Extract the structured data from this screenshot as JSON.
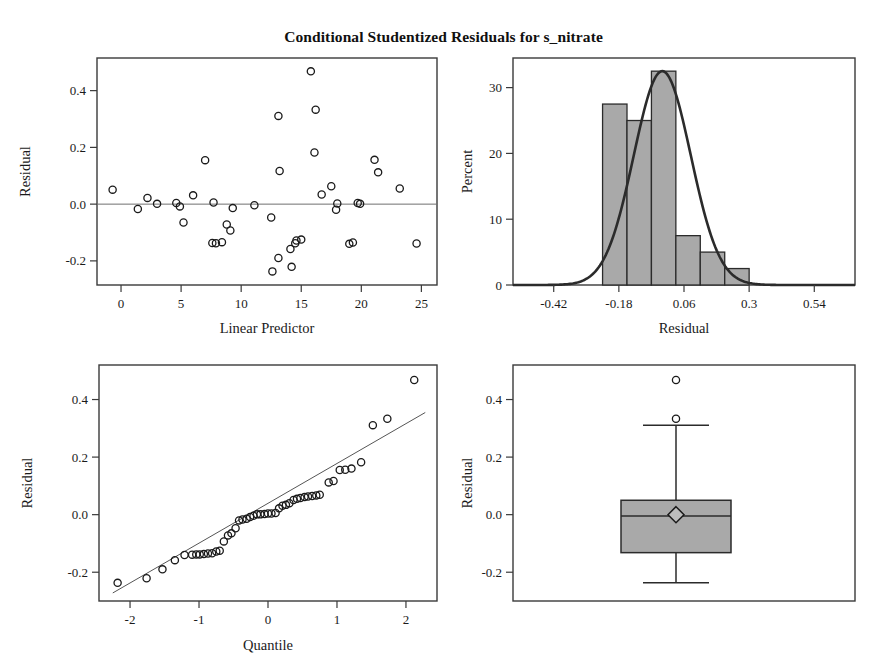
{
  "title": "Conditional Studentized Residuals for s_nitrate",
  "chart_data": [
    {
      "type": "scatter",
      "name": "residual-vs-linear-predictor",
      "title": "",
      "xlabel": "Linear Predictor",
      "ylabel": "Residual",
      "xlim": [
        -2.0,
        26.3
      ],
      "ylim": [
        -0.285,
        0.515
      ],
      "xticks": [
        0,
        5,
        10,
        15,
        20,
        25
      ],
      "xtick_labels": [
        "0",
        "5",
        "10",
        "15",
        "20",
        "25"
      ],
      "yticks": [
        -0.2,
        0.0,
        0.2,
        0.4
      ],
      "ytick_labels": [
        "-0.2",
        "0.0",
        "0.2",
        "0.4"
      ],
      "grid": false,
      "reference_line_y": 0.0,
      "points": [
        [
          -0.7,
          0.051
        ],
        [
          1.4,
          -0.017
        ],
        [
          2.2,
          0.022
        ],
        [
          3.0,
          0.001
        ],
        [
          4.6,
          0.004
        ],
        [
          4.9,
          -0.008
        ],
        [
          5.2,
          -0.065
        ],
        [
          6.0,
          0.031
        ],
        [
          7.0,
          0.155
        ],
        [
          7.6,
          -0.137
        ],
        [
          7.9,
          -0.138
        ],
        [
          8.4,
          -0.134
        ],
        [
          8.8,
          -0.072
        ],
        [
          9.1,
          -0.093
        ],
        [
          9.3,
          -0.014
        ],
        [
          7.7,
          0.006
        ],
        [
          11.1,
          -0.004
        ],
        [
          12.5,
          -0.047
        ],
        [
          12.6,
          -0.237
        ],
        [
          13.1,
          0.311
        ],
        [
          13.2,
          0.117
        ],
        [
          13.1,
          -0.19
        ],
        [
          14.1,
          -0.158
        ],
        [
          14.2,
          -0.221
        ],
        [
          14.5,
          -0.138
        ],
        [
          14.6,
          -0.128
        ],
        [
          15.0,
          -0.125
        ],
        [
          15.8,
          0.468
        ],
        [
          16.2,
          0.333
        ],
        [
          16.1,
          0.182
        ],
        [
          16.7,
          0.034
        ],
        [
          17.5,
          0.063
        ],
        [
          17.9,
          -0.02
        ],
        [
          18.0,
          0.002
        ],
        [
          19.0,
          -0.14
        ],
        [
          19.3,
          -0.135
        ],
        [
          19.7,
          0.004
        ],
        [
          19.9,
          0.001
        ],
        [
          21.1,
          0.156
        ],
        [
          21.4,
          0.112
        ],
        [
          23.2,
          0.055
        ],
        [
          24.6,
          -0.139
        ]
      ]
    },
    {
      "type": "bar",
      "name": "residual-histogram",
      "title": "",
      "xlabel": "Residual",
      "ylabel": "Percent",
      "xlim": [
        -0.57,
        0.69
      ],
      "ylim": [
        0,
        34.5
      ],
      "xticks": [
        -0.42,
        -0.18,
        0.06,
        0.3,
        0.54
      ],
      "xtick_labels": [
        "-0.42",
        "-0.18",
        "0.06",
        "0.3",
        "0.54"
      ],
      "yticks": [
        0,
        10,
        20,
        30
      ],
      "ytick_labels": [
        "0",
        "10",
        "20",
        "30"
      ],
      "grid": false,
      "bin_edges": [
        -0.24,
        -0.15,
        -0.06,
        0.03,
        0.12,
        0.21,
        0.3
      ],
      "bin_width": 0.09,
      "values": [
        27.5,
        25.0,
        32.5,
        7.5,
        5.0,
        2.5
      ],
      "overlay_curve": {
        "name": "normal-density",
        "mean": -0.02,
        "std": 0.105,
        "peak_percent": 32.5
      }
    },
    {
      "type": "scatter",
      "name": "residual-qq-plot",
      "title": "",
      "xlabel": "Quantile",
      "ylabel": "Residual",
      "xlim": [
        -2.45,
        2.45
      ],
      "ylim": [
        -0.3,
        0.52
      ],
      "xticks": [
        -2,
        -1,
        0,
        1,
        2
      ],
      "xtick_labels": [
        "-2",
        "-1",
        "0",
        "1",
        "2"
      ],
      "yticks": [
        -0.2,
        0.0,
        0.2,
        0.4
      ],
      "ytick_labels": [
        "-0.2",
        "0.0",
        "0.2",
        "0.4"
      ],
      "grid": false,
      "reference_line": {
        "x1": -2.25,
        "y1": -0.272,
        "x2": 2.28,
        "y2": 0.355
      },
      "points": [
        [
          -2.18,
          -0.237
        ],
        [
          -1.76,
          -0.221
        ],
        [
          -1.53,
          -0.19
        ],
        [
          -1.35,
          -0.158
        ],
        [
          -1.21,
          -0.14
        ],
        [
          -1.1,
          -0.139
        ],
        [
          -1.04,
          -0.138
        ],
        [
          -0.99,
          -0.138
        ],
        [
          -0.93,
          -0.137
        ],
        [
          -0.87,
          -0.135
        ],
        [
          -0.81,
          -0.134
        ],
        [
          -0.75,
          -0.128
        ],
        [
          -0.7,
          -0.125
        ],
        [
          -0.64,
          -0.093
        ],
        [
          -0.58,
          -0.072
        ],
        [
          -0.53,
          -0.065
        ],
        [
          -0.47,
          -0.047
        ],
        [
          -0.42,
          -0.02
        ],
        [
          -0.37,
          -0.017
        ],
        [
          -0.31,
          -0.014
        ],
        [
          -0.26,
          -0.008
        ],
        [
          -0.21,
          -0.004
        ],
        [
          -0.16,
          0.001
        ],
        [
          -0.11,
          0.001
        ],
        [
          -0.05,
          0.002
        ],
        [
          0.0,
          0.004
        ],
        [
          0.05,
          0.004
        ],
        [
          0.11,
          0.006
        ],
        [
          0.16,
          0.022
        ],
        [
          0.21,
          0.031
        ],
        [
          0.26,
          0.034
        ],
        [
          0.31,
          0.04
        ],
        [
          0.37,
          0.051
        ],
        [
          0.42,
          0.055
        ],
        [
          0.47,
          0.058
        ],
        [
          0.53,
          0.061
        ],
        [
          0.58,
          0.063
        ],
        [
          0.64,
          0.065
        ],
        [
          0.7,
          0.067
        ],
        [
          0.75,
          0.069
        ],
        [
          0.88,
          0.112
        ],
        [
          0.95,
          0.117
        ],
        [
          1.04,
          0.155
        ],
        [
          1.12,
          0.156
        ],
        [
          1.21,
          0.16
        ],
        [
          1.35,
          0.182
        ],
        [
          1.52,
          0.311
        ],
        [
          1.73,
          0.333
        ],
        [
          2.12,
          0.468
        ]
      ]
    },
    {
      "type": "box",
      "name": "residual-boxplot",
      "title": "",
      "xlabel": "",
      "ylabel": "Residual",
      "ylim": [
        -0.3,
        0.52
      ],
      "yticks": [
        -0.2,
        0.0,
        0.2,
        0.4
      ],
      "ytick_labels": [
        "-0.2",
        "0.0",
        "0.2",
        "0.4"
      ],
      "grid": false,
      "stats": {
        "whisker_low": -0.237,
        "q1": -0.132,
        "median": -0.005,
        "q3": 0.05,
        "whisker_high": 0.311,
        "mean": 0.0
      },
      "outliers": [
        0.468,
        0.333
      ]
    }
  ]
}
